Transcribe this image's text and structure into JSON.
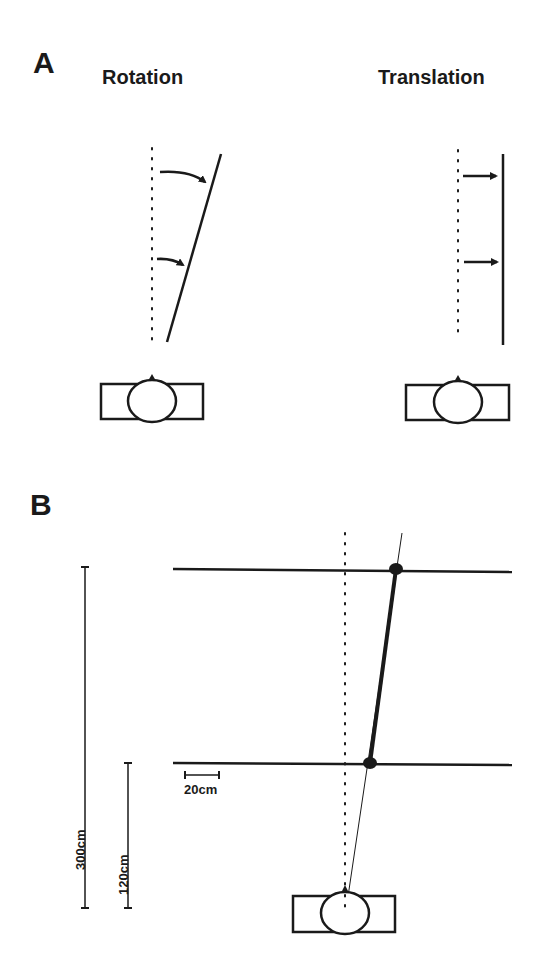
{
  "panel_a": {
    "letter": "A",
    "rotation_title": "Rotation",
    "translation_title": "Translation"
  },
  "panel_b": {
    "letter": "B",
    "scale_300": "300cm",
    "scale_120": "120cm",
    "scale_20": "20cm"
  },
  "colors": {
    "ink": "#1a1a1a",
    "background": "#ffffff"
  }
}
